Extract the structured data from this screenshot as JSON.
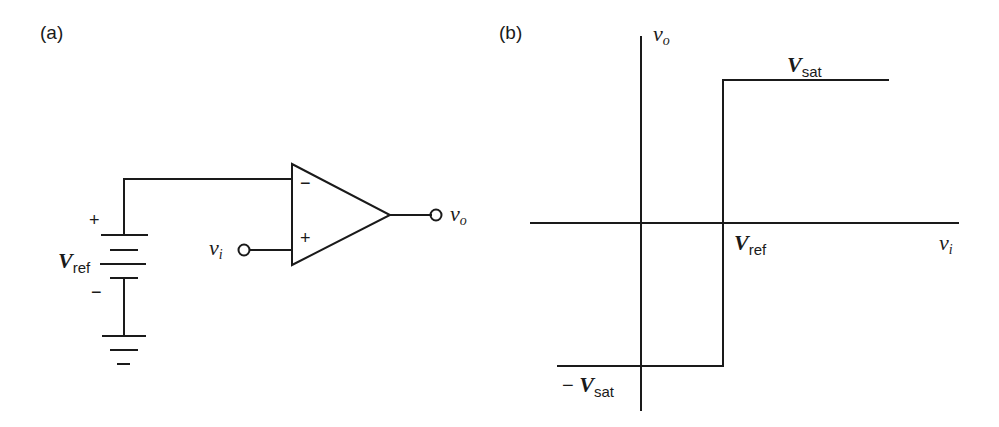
{
  "panels": {
    "a": {
      "label": "(a)",
      "battery": {
        "plus": "+",
        "minus": "−",
        "name": "V",
        "subscript": "ref"
      },
      "opamp": {
        "inverting": "−",
        "noninverting": "+"
      },
      "input": {
        "name": "v",
        "subscript": "i"
      },
      "output": {
        "name": "v",
        "subscript": "o"
      }
    },
    "b": {
      "label": "(b)",
      "y_axis": {
        "name": "v",
        "subscript": "o"
      },
      "x_axis": {
        "name": "v",
        "subscript": "i"
      },
      "vref": {
        "name": "V",
        "subscript": "ref"
      },
      "vsat_pos": {
        "name": "V",
        "subscript": "sat"
      },
      "vsat_neg": {
        "prefix": "−",
        "name": "V",
        "subscript": "sat"
      }
    }
  },
  "colors": {
    "ink": "#1a1a1a",
    "background": "#ffffff"
  }
}
